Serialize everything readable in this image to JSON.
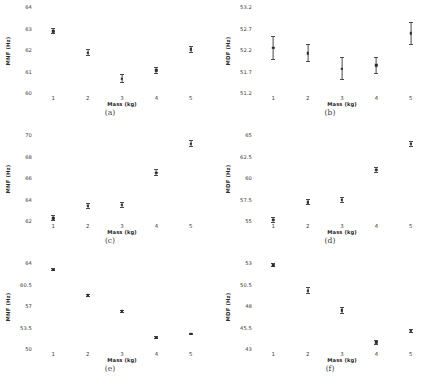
{
  "figure": {
    "width": 440,
    "height": 384,
    "background": "#ffffff",
    "marker_color": "#2a2a2a",
    "errorbar_color": "#4a4a4a",
    "grid": false,
    "layout": "2 columns x 3 rows of subplots",
    "shared_xlabel": "Mass (kg)",
    "shared_xticks": [
      "1",
      "2",
      "3",
      "4",
      "5"
    ]
  },
  "chart_data": [
    {
      "type": "scatter",
      "panel": "(a)",
      "title": "",
      "xlabel": "Mass (kg)",
      "ylabel": "MNF (Hz)",
      "x": [
        1,
        2,
        3,
        4,
        5
      ],
      "xticklabels": [
        "1",
        "2",
        "3",
        "4",
        "5"
      ],
      "xlim": [
        0.5,
        5.5
      ],
      "yticklabels": [
        "60",
        "61",
        "62",
        "63",
        "64"
      ],
      "ylim": [
        60,
        64
      ],
      "values": [
        62.92,
        61.92,
        60.72,
        61.1,
        62.07
      ],
      "errors": [
        0.14,
        0.16,
        0.2,
        0.16,
        0.14
      ],
      "legend": null
    },
    {
      "type": "scatter",
      "panel": "(b)",
      "title": "",
      "xlabel": "Mass (kg)",
      "ylabel": "MDF (Hz)",
      "x": [
        1,
        2,
        3,
        4,
        5
      ],
      "xticklabels": [
        "1",
        "2",
        "3",
        "4",
        "5"
      ],
      "xlim": [
        0.5,
        5.5
      ],
      "yticklabels": [
        "51.2",
        "51.7",
        "52.2",
        "52.7",
        "53.2"
      ],
      "ylim": [
        51.2,
        53.2
      ],
      "values": [
        52.28,
        52.15,
        51.79,
        51.87,
        52.61
      ],
      "errors": [
        0.28,
        0.21,
        0.26,
        0.2,
        0.26
      ],
      "legend": null
    },
    {
      "type": "scatter",
      "panel": "(c)",
      "title": "",
      "xlabel": "Mass (kg)",
      "ylabel": "MNF (Hz)",
      "x": [
        1,
        2,
        3,
        4,
        5
      ],
      "xticklabels": [
        "1",
        "2",
        "3",
        "4",
        "5"
      ],
      "xlim": [
        0.5,
        5.5
      ],
      "yticklabels": [
        "62",
        "64",
        "66",
        "68",
        "70"
      ],
      "ylim": [
        62,
        70
      ],
      "values": [
        62.35,
        63.5,
        63.6,
        66.6,
        69.3
      ],
      "errors": [
        0.28,
        0.3,
        0.3,
        0.3,
        0.3
      ],
      "legend": null
    },
    {
      "type": "scatter",
      "panel": "(d)",
      "title": "",
      "xlabel": "Mass (kg)",
      "ylabel": "MDF (Hz)",
      "x": [
        1,
        2,
        3,
        4,
        5
      ],
      "xticklabels": [
        "1",
        "2",
        "3",
        "4",
        "5"
      ],
      "xlim": [
        0.5,
        5.5
      ],
      "yticklabels": [
        "55",
        "57.5",
        "60",
        "62.5",
        "65"
      ],
      "ylim": [
        55,
        65
      ],
      "values": [
        55.25,
        57.3,
        57.6,
        61.1,
        64.1
      ],
      "errors": [
        0.33,
        0.35,
        0.33,
        0.35,
        0.33
      ],
      "legend": null
    },
    {
      "type": "scatter",
      "panel": "(e)",
      "title": "",
      "xlabel": "Mass (kg)",
      "ylabel": "MNF (Hz)",
      "x": [
        1,
        2,
        3,
        4,
        5
      ],
      "xticklabels": [
        "1",
        "2",
        "3",
        "4",
        "5"
      ],
      "xlim": [
        0.5,
        5.5
      ],
      "yticklabels": [
        "50",
        "53.5",
        "57",
        "60.5",
        "64"
      ],
      "ylim": [
        50,
        64
      ],
      "values": [
        63.1,
        58.9,
        56.3,
        52.0,
        52.6
      ],
      "errors": [
        0.2,
        0.22,
        0.22,
        0.22,
        0.2
      ],
      "legend": null
    },
    {
      "type": "scatter",
      "panel": "(f)",
      "title": "",
      "xlabel": "Mass (kg)",
      "ylabel": "MDF (Hz)",
      "x": [
        1,
        2,
        3,
        4,
        5
      ],
      "xticklabels": [
        "1",
        "2",
        "3",
        "4",
        "5"
      ],
      "xlim": [
        0.5,
        5.5
      ],
      "yticklabels": [
        "43",
        "45.5",
        "48",
        "50.5",
        "53"
      ],
      "ylim": [
        43,
        53
      ],
      "values": [
        52.85,
        49.9,
        47.6,
        43.9,
        45.2
      ],
      "errors": [
        0.22,
        0.38,
        0.42,
        0.26,
        0.22
      ],
      "legend": null
    }
  ]
}
